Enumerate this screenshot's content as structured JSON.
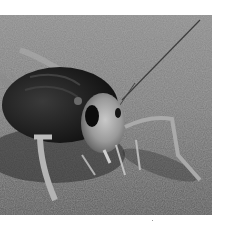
{
  "image": {
    "subject": "cricket on sand",
    "style": "grayscale photograph",
    "colors": {
      "background": "#ffffff",
      "sand_light": "#9a9a9a",
      "sand_dark": "#4a4a4a",
      "body_dark": "#1e1e1e",
      "head_light": "#b8b8b8"
    }
  }
}
